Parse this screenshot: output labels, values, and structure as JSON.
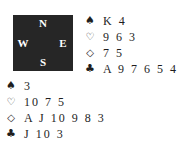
{
  "compass": {
    "north": "N",
    "west": "W",
    "east": "E",
    "south": "S"
  },
  "suit_icons": {
    "spades": "♠",
    "hearts": "♡",
    "diamonds": "◇",
    "clubs": "♣"
  },
  "hands": {
    "north": {
      "spades": "K 4",
      "hearts": "9 6 3",
      "diamonds": "7 5",
      "clubs": "A 9 7 6 5 4"
    },
    "west": {
      "spades": "3",
      "hearts": "10 7 5",
      "diamonds": "A J 10 9 8 3",
      "clubs": "J 10 3"
    }
  }
}
